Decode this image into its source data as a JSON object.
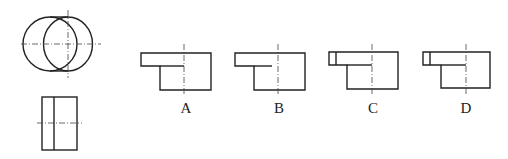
{
  "figure": {
    "given_views": {
      "top_view": "two overlapping circles (larger right circle with center lines)",
      "front_view": "rectangle with one vertical interior line and horizontal center line"
    },
    "options": [
      {
        "label": "A",
        "description": "stepped profile, interior line extends to centerline"
      },
      {
        "label": "B",
        "description": "stepped profile, interior line stops before centerline"
      },
      {
        "label": "C",
        "description": "stepped profile with small vertical line at left end of top strip, interior line to centerline"
      },
      {
        "label": "D",
        "description": "stepped profile with small vertical line at left end of top strip, interior line to centerline"
      }
    ]
  }
}
